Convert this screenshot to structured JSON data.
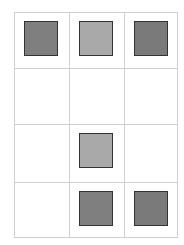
{
  "grid": {
    "rows": 4,
    "cols": 3,
    "line_color": "#d0d0d0"
  },
  "cells": [
    {
      "row": 0,
      "col": 0,
      "filled": true,
      "shade": "dark",
      "color": "#7f7f7f"
    },
    {
      "row": 0,
      "col": 1,
      "filled": true,
      "shade": "light",
      "color": "#a9a9a9"
    },
    {
      "row": 0,
      "col": 2,
      "filled": true,
      "shade": "dark",
      "color": "#7a7a7a"
    },
    {
      "row": 1,
      "col": 0,
      "filled": false
    },
    {
      "row": 1,
      "col": 1,
      "filled": false
    },
    {
      "row": 1,
      "col": 2,
      "filled": false
    },
    {
      "row": 2,
      "col": 0,
      "filled": false
    },
    {
      "row": 2,
      "col": 1,
      "filled": true,
      "shade": "light",
      "color": "#a9a9a9"
    },
    {
      "row": 2,
      "col": 2,
      "filled": false
    },
    {
      "row": 3,
      "col": 0,
      "filled": false
    },
    {
      "row": 3,
      "col": 1,
      "filled": true,
      "shade": "dark",
      "color": "#7f7f7f"
    },
    {
      "row": 3,
      "col": 2,
      "filled": true,
      "shade": "dark",
      "color": "#7a7a7a"
    }
  ]
}
